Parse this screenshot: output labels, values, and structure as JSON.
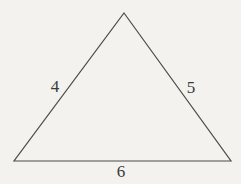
{
  "figure": {
    "type": "triangle-diagram",
    "background_color": "#f3f2ef",
    "line_color": "#4c4b49",
    "label_color": "#3a3a38",
    "vertices": {
      "apex": {
        "x": 124,
        "y": 13
      },
      "bottom_left": {
        "x": 14,
        "y": 161
      },
      "bottom_right": {
        "x": 231,
        "y": 161
      }
    },
    "side_labels": [
      {
        "text": "4",
        "side": "left",
        "x": 55,
        "y": 92
      },
      {
        "text": "5",
        "side": "right",
        "x": 191,
        "y": 93
      },
      {
        "text": "6",
        "side": "bottom",
        "x": 121,
        "y": 177
      }
    ]
  }
}
